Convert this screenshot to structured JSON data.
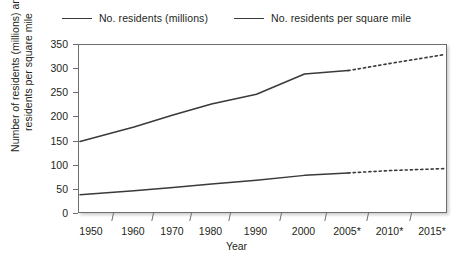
{
  "chart_data": {
    "type": "line",
    "title": "",
    "xlabel": "Year",
    "ylabel_line1": "Number of residents (millions) and",
    "ylabel_line2": "residents per square mile",
    "x": [
      1950,
      1960,
      1970,
      1980,
      1990,
      2000,
      2005,
      2010,
      2015
    ],
    "categories": [
      "1950",
      "1960",
      "1970",
      "1980",
      "1990",
      "2000",
      "2005*",
      "2010*",
      "2015*"
    ],
    "ylim": [
      0,
      350
    ],
    "yticks": [
      0,
      50,
      100,
      150,
      200,
      250,
      300,
      350
    ],
    "ytick_labels": [
      "0",
      "50",
      "100",
      "150",
      "200",
      "250",
      "300",
      "350"
    ],
    "grid": false,
    "legend_position": "top-center",
    "projection_note": "* denotes projected values, drawn as dotted line segments",
    "projection_start_year": 2005,
    "series": [
      {
        "name": "No. residents (millions)",
        "color": "#3a3a3c",
        "values": [
          40,
          48,
          55,
          62,
          70,
          80,
          85,
          90,
          94
        ],
        "solid_through": 2005
      },
      {
        "name": "No. residents per square mile",
        "color": "#3a3a3c",
        "values": [
          150,
          180,
          205,
          228,
          248,
          290,
          297,
          312,
          330
        ],
        "solid_through": 2005
      }
    ]
  },
  "legend": {
    "entries": [
      {
        "label": "No. residents (millions)"
      },
      {
        "label": "No. residents per square mile"
      }
    ]
  },
  "axes": {
    "x_title": "Year",
    "y_title_line1": "Number of residents (millions) and",
    "y_title_line2": "residents per square mile"
  }
}
